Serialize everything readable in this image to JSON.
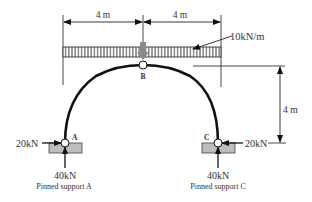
{
  "dimensions": {
    "span_left": "4 m",
    "span_right": "4 m",
    "rise": "4 m"
  },
  "load": {
    "distributed": "10kN/m"
  },
  "nodes": {
    "a": "A",
    "b": "B",
    "c": "C"
  },
  "forces": {
    "a_horizontal": "20kN",
    "a_vertical": "40kN",
    "c_horizontal": "20kN",
    "c_vertical": "40kN"
  },
  "supports": {
    "a_caption": "Pinned support A",
    "c_caption": "Pinned support C"
  },
  "colors": {
    "line": "#222222",
    "arch": "#111111",
    "support": "#bdbdbd",
    "load_arrow": "#8a8a8a"
  }
}
